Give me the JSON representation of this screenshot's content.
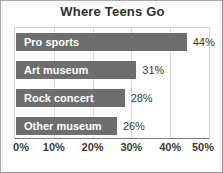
{
  "chart_data": {
    "type": "bar",
    "orientation": "horizontal",
    "title": "Where Teens Go",
    "xlabel": "",
    "ylabel": "",
    "categories": [
      "Pro sports",
      "Art museum",
      "Rock concert",
      "Other museum"
    ],
    "values": [
      44,
      31,
      28,
      26
    ],
    "value_labels": [
      "44%",
      "31%",
      "28%",
      "26%"
    ],
    "xlim": [
      0,
      50
    ],
    "xticks": [
      0,
      10,
      20,
      30,
      40,
      50
    ],
    "xtick_labels": [
      "0%",
      "10%",
      "20%",
      "30%",
      "40%",
      "50%"
    ],
    "grid": true,
    "grid_axis": "x",
    "legend": false,
    "bar_color": "#6e6e6e",
    "bar_label_color": "#ffffff",
    "value_label_color": "#3a3a3a",
    "title_color": "#2e2e2e",
    "background_color": "#ffffff",
    "gridline_color": "#d6d6d6",
    "axis_color": "#7c7c7c",
    "frame_color": "#a8a8a8",
    "bars": [
      {
        "category": "Pro sports",
        "value": 44,
        "value_label": "44%"
      },
      {
        "category": "Art museum",
        "value": 31,
        "value_label": "31%"
      },
      {
        "category": "Rock concert",
        "value": 28,
        "value_label": "28%"
      },
      {
        "category": "Other museum",
        "value": 26,
        "value_label": "26%"
      }
    ]
  }
}
